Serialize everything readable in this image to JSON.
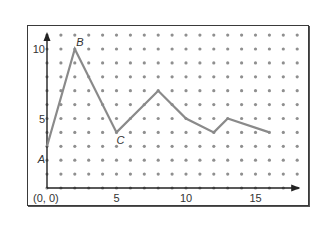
{
  "chart_data": {
    "type": "line",
    "title": "",
    "xlabel": "",
    "ylabel": "",
    "origin_label": "(0, 0)",
    "xlim": [
      0,
      18
    ],
    "ylim": [
      0,
      11
    ],
    "x_ticks": [
      {
        "value": 5,
        "label": "5"
      },
      {
        "value": 10,
        "label": "10"
      },
      {
        "value": 15,
        "label": "15"
      }
    ],
    "y_ticks": [
      {
        "value": 5,
        "label": "5"
      },
      {
        "value": 10,
        "label": "10"
      }
    ],
    "grid": "dot-grid",
    "series": [
      {
        "name": "path",
        "color": "#8a8a8a",
        "points": [
          {
            "x": 0,
            "y": 3
          },
          {
            "x": 2,
            "y": 10
          },
          {
            "x": 5,
            "y": 4
          },
          {
            "x": 8,
            "y": 7
          },
          {
            "x": 10,
            "y": 5
          },
          {
            "x": 12,
            "y": 4
          },
          {
            "x": 13,
            "y": 5
          },
          {
            "x": 16,
            "y": 4
          }
        ]
      }
    ],
    "point_labels": [
      {
        "label": "A",
        "x": 0,
        "y": 3,
        "position": "left-below"
      },
      {
        "label": "B",
        "x": 2,
        "y": 10,
        "position": "above"
      },
      {
        "label": "C",
        "x": 5,
        "y": 4,
        "position": "below"
      }
    ],
    "colors": {
      "axis": "#222222",
      "dot": "#8f8f8f",
      "line": "#8a8a8a",
      "frame": "#3a3a3a"
    }
  }
}
